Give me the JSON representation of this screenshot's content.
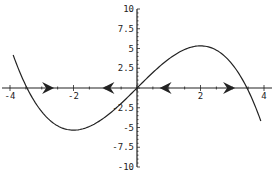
{
  "chart_data": {
    "type": "line",
    "title": "",
    "xlabel": "",
    "ylabel": "",
    "xlim": [
      -4.2,
      4.2
    ],
    "ylim": [
      -10,
      10
    ],
    "grid": false,
    "x_ticks": [
      -4,
      -2,
      2,
      4
    ],
    "x_tick_labels": [
      "-4",
      "-2",
      "2",
      "4"
    ],
    "y_ticks": [
      10,
      7.5,
      5,
      2.5,
      -2.5,
      -5,
      -7.5,
      -10
    ],
    "y_tick_labels": [
      "10",
      "7.5",
      "5",
      "2.5",
      "-2.5",
      "-5",
      "-7.5",
      "-10"
    ],
    "series": [
      {
        "name": "f(x)",
        "description": "cubic curve approx 4x - x^3/3",
        "x": [
          -4,
          -3.5,
          -3,
          -2.5,
          -2,
          -1.5,
          -1,
          -0.5,
          0,
          0.5,
          1,
          1.5,
          2,
          2.5,
          3,
          3.5,
          4
        ],
        "values": [
          5.33,
          -0.29,
          -3.0,
          -4.79,
          -5.33,
          -4.88,
          -3.67,
          -1.96,
          0,
          1.96,
          3.67,
          4.88,
          5.33,
          4.79,
          3.0,
          0.29,
          -5.33
        ]
      }
    ],
    "phase_arrows": [
      {
        "x": -2.8,
        "direction": "right"
      },
      {
        "x": -0.9,
        "direction": "left"
      },
      {
        "x": 0.9,
        "direction": "left"
      },
      {
        "x": 2.9,
        "direction": "right"
      }
    ],
    "legend": null,
    "color": "#222222"
  }
}
